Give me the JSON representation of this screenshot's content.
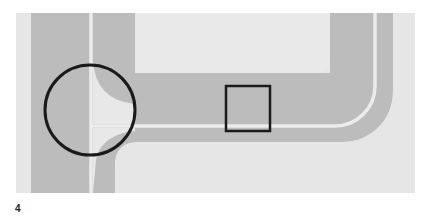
{
  "figure": {
    "number": "4",
    "colors": {
      "page": "#ffffff",
      "ground": "#e6e6e6",
      "road": "#bcbcbc",
      "lane_line": "#ebebeb",
      "inner_block": "#e9e9e9",
      "marker": "#1a1a1a"
    },
    "annotations": [
      {
        "type": "circle",
        "label": "junction-highlight",
        "cx": 90,
        "cy": 110,
        "r": 45
      },
      {
        "type": "square",
        "label": "detail-highlight",
        "x": 226,
        "y": 86,
        "w": 44,
        "h": 45
      }
    ]
  }
}
